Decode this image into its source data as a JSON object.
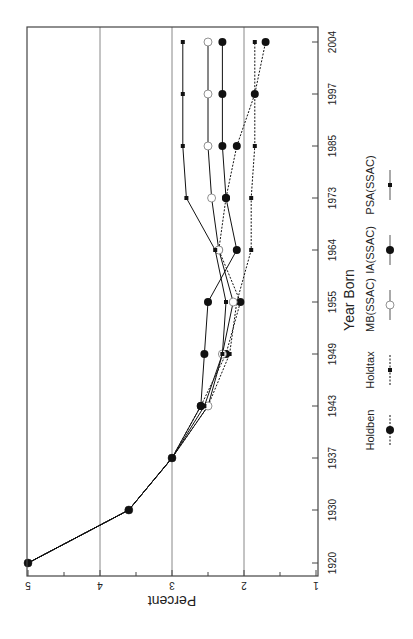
{
  "chart_data": {
    "type": "line",
    "orientation": "rotated-90-clockwise",
    "title": "",
    "xlabel": "Year Born",
    "ylabel": "Percent",
    "ylim": [
      1,
      5
    ],
    "yticks": [
      1,
      2,
      3,
      4,
      5
    ],
    "grid": "horizontal at major y ticks",
    "categories": [
      "1920",
      "1930",
      "1937",
      "1943",
      "1949",
      "1955",
      "1964",
      "1973",
      "1985",
      "1997",
      "2004"
    ],
    "series": [
      {
        "name": "Holdben",
        "style": "dotted",
        "marker": "large-filled-circle",
        "values": [
          5.0,
          3.6,
          3.0,
          2.6,
          2.25,
          2.05,
          2.35,
          2.25,
          2.1,
          1.85,
          1.7
        ]
      },
      {
        "name": "Holdtax",
        "style": "dotted",
        "marker": "small-filled-square",
        "values": [
          5.0,
          3.6,
          3.0,
          2.5,
          2.2,
          2.1,
          1.9,
          1.9,
          1.85,
          1.85,
          1.85
        ]
      },
      {
        "name": "MB(SSAC)",
        "style": "solid",
        "marker": "open-circle",
        "values": [
          5.0,
          3.6,
          3.0,
          2.5,
          2.3,
          2.15,
          2.35,
          2.45,
          2.5,
          2.5,
          2.5
        ]
      },
      {
        "name": "IA(SSAC)",
        "style": "solid",
        "marker": "large-filled-circle",
        "values": [
          5.0,
          3.6,
          3.0,
          2.6,
          2.55,
          2.5,
          2.1,
          2.25,
          2.3,
          2.3,
          2.3
        ]
      },
      {
        "name": "PSA(SSAC)",
        "style": "solid",
        "marker": "small-filled-square",
        "values": [
          5.0,
          3.6,
          3.0,
          2.55,
          2.3,
          2.25,
          2.4,
          2.8,
          2.85,
          2.85,
          2.85
        ]
      }
    ],
    "legend": {
      "position": "bottom (right edge when rotated)",
      "entries": [
        "Holdben",
        "Holdtax",
        "MB(SSAC)",
        "IA(SSAC)",
        "PSA(SSAC)"
      ]
    }
  },
  "colors": {
    "line": "#111111",
    "grid": "#888888",
    "frame": "#444444"
  }
}
